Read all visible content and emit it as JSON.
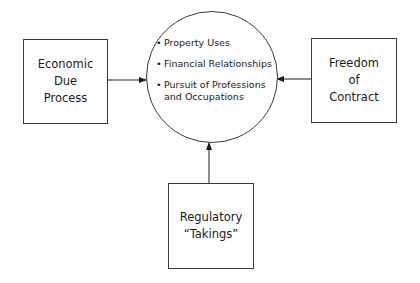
{
  "diagram": {
    "center": {
      "items": [
        {
          "bullet": "•",
          "lines": [
            "Property Uses"
          ]
        },
        {
          "bullet": "•",
          "lines": [
            "Financial Relationships"
          ]
        },
        {
          "bullet": "•",
          "lines": [
            "Pursuit of Professions",
            "and Occupations"
          ]
        }
      ]
    },
    "left_box": {
      "lines": [
        "Economic",
        "Due",
        "Process"
      ]
    },
    "right_box": {
      "lines": [
        "Freedom",
        "of",
        "Contract"
      ]
    },
    "bottom_box": {
      "lines": [
        "Regulatory",
        "“Takings”"
      ]
    },
    "colors": {
      "stroke": "#3a3a3a",
      "text": "#1a1a1a",
      "background": "#ffffff"
    }
  }
}
